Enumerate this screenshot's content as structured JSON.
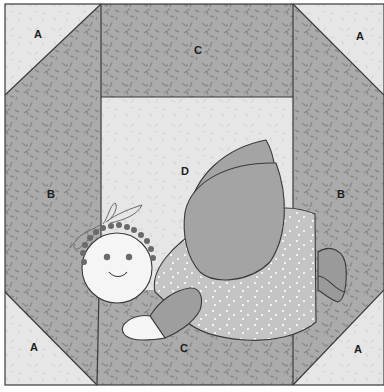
{
  "colors": {
    "light_fabric": "#e6e6e6",
    "medium_fabric": "#a9a9a9",
    "wing": "#a4a4a4",
    "dress": "#c4c4c4",
    "face": "#f5f5f5",
    "outline": "#3a3a3a",
    "hair_dots": "#6a6a6a"
  },
  "pieces": {
    "a_top_left": "A",
    "a_top_right": "A",
    "a_bottom_left": "A",
    "a_bottom_right": "A",
    "b_left": "B",
    "b_right": "B",
    "c_top": "C",
    "c_bottom": "C",
    "d_center": "D"
  },
  "applique": [
    "head with hair dots and bow",
    "two wings",
    "dotted dress",
    "arm with hand",
    "foot"
  ]
}
